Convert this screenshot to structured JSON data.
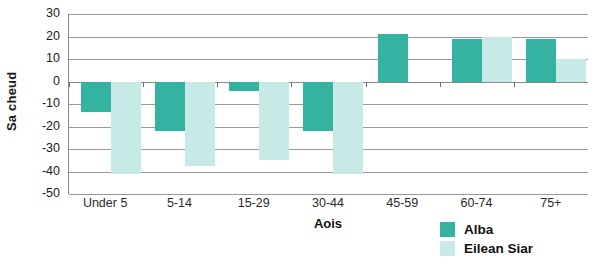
{
  "chart_data": {
    "type": "bar",
    "title": "",
    "xlabel": "Aois",
    "ylabel": "Sa cheud",
    "categories": [
      "Under 5",
      "5-14",
      "15-29",
      "30-44",
      "45-59",
      "60-74",
      "75+"
    ],
    "series": [
      {
        "name": "Alba",
        "color": "#34b3a0",
        "values": [
          -13.5,
          -22,
          -4,
          -22,
          21,
          19,
          19
        ]
      },
      {
        "name": "Eilean Siar",
        "color": "#c8eae6",
        "values": [
          -41,
          -37.5,
          -35,
          -41,
          0,
          20,
          10
        ]
      }
    ],
    "ylim": [
      -50,
      30
    ],
    "yticks": [
      30,
      20,
      10,
      0,
      -10,
      -20,
      -30,
      -40,
      -50
    ],
    "ytick_labels": [
      "30",
      "20",
      "10",
      "0",
      "-10",
      "-20",
      "-30",
      "-40",
      "-50"
    ],
    "grid": true,
    "legend_position": "bottom-right"
  },
  "legend": {
    "items": [
      {
        "label": "Alba",
        "color": "#34b3a0"
      },
      {
        "label": "Eilean Siar",
        "color": "#c8eae6"
      }
    ]
  }
}
